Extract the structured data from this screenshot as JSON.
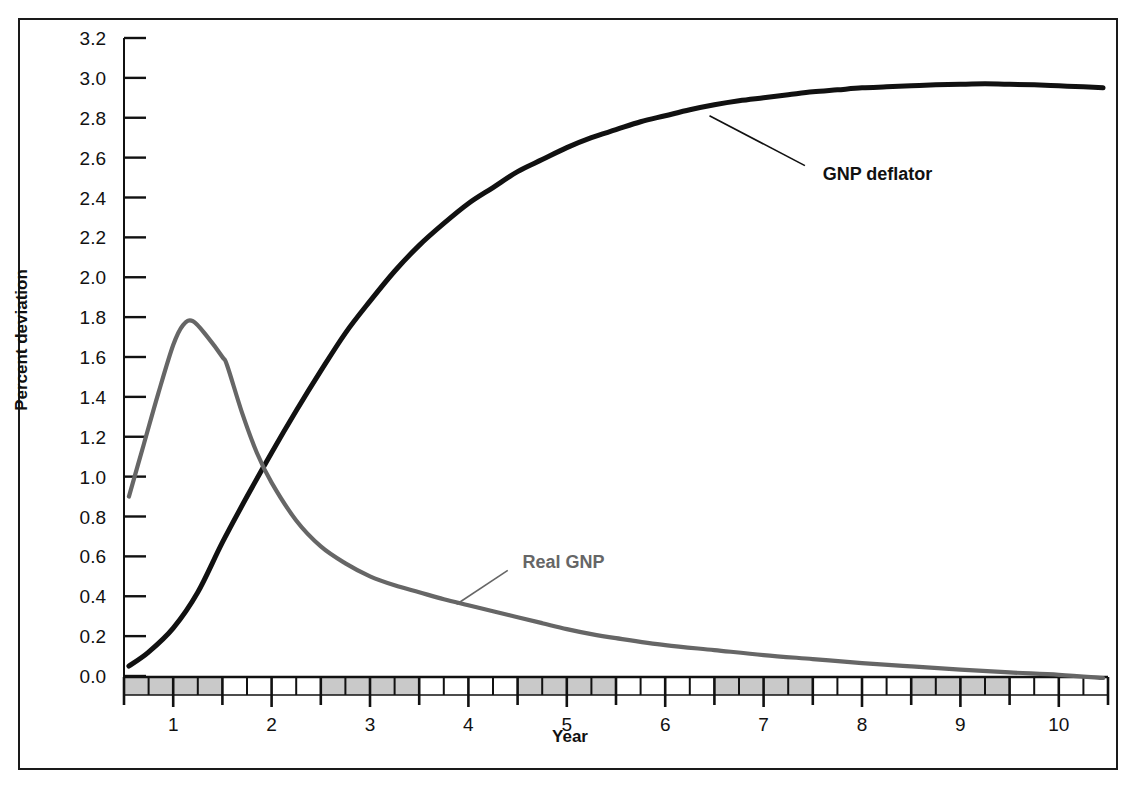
{
  "chart_data": {
    "type": "line",
    "title": "",
    "xlabel": "Year",
    "ylabel": "Percent deviation",
    "xlim": [
      0.5,
      10.5
    ],
    "ylim": [
      0.0,
      3.2
    ],
    "grid": false,
    "legend_position": "inline-annotations",
    "y_ticks": [
      "0.0",
      "0.2",
      "0.4",
      "0.6",
      "0.8",
      "1.0",
      "1.2",
      "1.4",
      "1.6",
      "1.8",
      "2.0",
      "2.2",
      "2.4",
      "2.6",
      "2.8",
      "3.0",
      "3.2"
    ],
    "y_tick_values": [
      0.0,
      0.2,
      0.4,
      0.6,
      0.8,
      1.0,
      1.2,
      1.4,
      1.6,
      1.8,
      2.0,
      2.2,
      2.4,
      2.6,
      2.8,
      3.0,
      3.2
    ],
    "x_ticks": [
      "1",
      "2",
      "3",
      "4",
      "5",
      "6",
      "7",
      "8",
      "9",
      "10"
    ],
    "x_tick_values": [
      1,
      2,
      3,
      4,
      5,
      6,
      7,
      8,
      9,
      10
    ],
    "x_minor_step": 0.25,
    "shaded_bands": [
      [
        0.5,
        1.5
      ],
      [
        2.5,
        3.5
      ],
      [
        4.5,
        5.5
      ],
      [
        6.5,
        7.5
      ],
      [
        8.5,
        9.5
      ]
    ],
    "series": [
      {
        "name": "GNP deflator",
        "color": "#111111",
        "label_color": "#111111",
        "label_x": 7.6,
        "label_y": 2.52,
        "leader": [
          [
            7.42,
            2.56
          ],
          [
            6.45,
            2.81
          ]
        ],
        "x": [
          0.55,
          0.75,
          1.0,
          1.25,
          1.5,
          1.75,
          2.0,
          2.25,
          2.5,
          2.75,
          3.0,
          3.25,
          3.5,
          3.75,
          4.0,
          4.25,
          4.5,
          4.75,
          5.0,
          5.25,
          5.5,
          5.75,
          6.0,
          6.25,
          6.5,
          6.75,
          7.0,
          7.25,
          7.5,
          7.75,
          8.0,
          8.25,
          8.5,
          8.75,
          9.0,
          9.25,
          9.5,
          9.75,
          10.0,
          10.25,
          10.45
        ],
        "y": [
          0.05,
          0.12,
          0.24,
          0.42,
          0.67,
          0.9,
          1.12,
          1.33,
          1.53,
          1.72,
          1.88,
          2.03,
          2.16,
          2.27,
          2.37,
          2.45,
          2.53,
          2.59,
          2.65,
          2.7,
          2.74,
          2.78,
          2.81,
          2.84,
          2.865,
          2.885,
          2.9,
          2.915,
          2.93,
          2.94,
          2.95,
          2.955,
          2.96,
          2.965,
          2.968,
          2.97,
          2.968,
          2.965,
          2.96,
          2.955,
          2.95
        ]
      },
      {
        "name": "Real GNP",
        "color": "#666666",
        "label_color": "#666666",
        "label_x": 4.55,
        "label_y": 0.57,
        "leader": [
          [
            4.4,
            0.53
          ],
          [
            3.88,
            0.36
          ]
        ],
        "x": [
          0.55,
          0.7,
          0.85,
          1.0,
          1.1,
          1.2,
          1.35,
          1.5,
          1.55,
          1.7,
          1.85,
          2.0,
          2.25,
          2.5,
          2.75,
          3.0,
          3.25,
          3.5,
          3.75,
          4.0,
          4.25,
          4.5,
          4.75,
          5.0,
          5.25,
          5.5,
          6.0,
          6.5,
          7.0,
          7.5,
          8.0,
          8.5,
          9.0,
          9.5,
          10.0,
          10.45
        ],
        "y": [
          0.9,
          1.16,
          1.42,
          1.66,
          1.76,
          1.78,
          1.7,
          1.6,
          1.555,
          1.32,
          1.12,
          0.97,
          0.78,
          0.65,
          0.565,
          0.5,
          0.455,
          0.42,
          0.385,
          0.355,
          0.325,
          0.295,
          0.265,
          0.235,
          0.21,
          0.19,
          0.155,
          0.13,
          0.105,
          0.085,
          0.065,
          0.048,
          0.032,
          0.018,
          0.006,
          -0.01
        ]
      }
    ]
  },
  "axis": {
    "y_title": "Percent deviation",
    "x_title": "Year"
  }
}
